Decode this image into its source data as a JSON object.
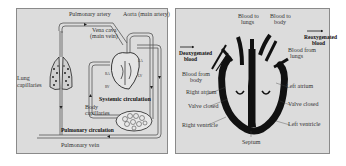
{
  "left_diagram": {
    "title": "Double circulation",
    "labels": {
      "pulmonary_artery": "Pulmonary artery",
      "aorta": "Aorta (main artery)",
      "vena_cava_1": "Vena cava",
      "vena_cava_2": "(main vein)",
      "lung_capillaries_1": "Lung",
      "lung_capillaries_2": "capillaries",
      "systemic_circulation": "Systemic circulation",
      "body_capillaries_1": "Body",
      "body_capillaries_2": "capillaries",
      "pulmonary_circulation": "Pulmonary circulation",
      "pulmonary_vein": "Pulmonary vein",
      "ra": "RA",
      "la": "LA",
      "rv": "RV",
      "lv": "LV"
    }
  },
  "right_diagram": {
    "title": "Heart cross-section",
    "labels": {
      "deoxygenated_1": "Deoxygenated",
      "deoxygenated_2": "blood",
      "reoxygenated_1": "Reoxygenated",
      "reoxygenated_2": "blood",
      "blood_to_lungs_1": "Blood to",
      "blood_to_lungs_2": "lungs",
      "blood_to_body_1": "Blood to",
      "blood_to_body_2": "body",
      "blood_from_lungs_1": "Blood from",
      "blood_from_lungs_2": "lungs",
      "blood_from_body_1": "Blood from",
      "blood_from_body_2": "body",
      "right_atrium": "Right atrium",
      "left_atrium": "Left atrium",
      "valve_closed_left": "Valve closed",
      "valve_closed_right": "Valve closed",
      "right_ventricle": "Right ventricle",
      "left_ventricle": "Left ventricle",
      "septum": "Septum"
    }
  },
  "colors": {
    "panel_bg": "#dcdcdc",
    "ink": "#111111",
    "line": "#555555"
  }
}
